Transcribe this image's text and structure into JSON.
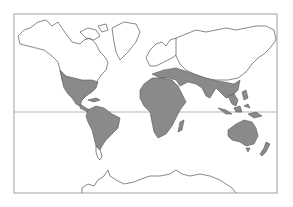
{
  "map": {
    "type": "world-map",
    "projection": "mercator-like",
    "frame": {
      "x": 14,
      "y": 14,
      "width": 263,
      "height": 179
    },
    "equator_y": 112,
    "colors": {
      "background": "#ffffff",
      "land": "#ffffff",
      "outline": "#555555",
      "shaded_region": "#8a8a8a",
      "frame": "#888888"
    },
    "shaded_regions": [
      "Southern United States",
      "Mexico and Central America",
      "Caribbean",
      "South America (except southern tip)",
      "Africa",
      "Madagascar",
      "Southern Europe / Mediterranean",
      "Middle East / Arabian Peninsula",
      "Southern Asia / India",
      "Southeast Asia",
      "Indonesia / Philippines / New Guinea",
      "Australia",
      "New Zealand"
    ],
    "unshaded_regions": [
      "Canada / Alaska",
      "Greenland",
      "Northern Europe",
      "Russia / Siberia",
      "Northern China / Mongolia",
      "Antarctica",
      "Patagonia"
    ]
  }
}
